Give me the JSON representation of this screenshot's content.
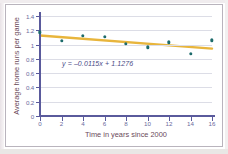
{
  "chart_data": {
    "type": "scatter",
    "title": "",
    "xlabel": "Time in years since 2000",
    "ylabel": "Average home runs per game",
    "xlim": [
      0,
      16
    ],
    "ylim": [
      0,
      1.4
    ],
    "grid": true,
    "legend": "none",
    "x_ticks": [
      "0",
      "2",
      "4",
      "6",
      "8",
      "10",
      "12",
      "14",
      "16"
    ],
    "y_ticks": [
      "0",
      "0.2",
      "0.4",
      "0.6",
      "0.8",
      "1",
      "1.2",
      "1.4"
    ],
    "x": [
      0,
      2,
      4,
      6,
      8,
      10,
      12,
      14,
      16
    ],
    "values": [
      1.17,
      1.05,
      1.12,
      1.11,
      1.01,
      0.96,
      1.03,
      0.87,
      1.06
    ],
    "annotation": "y = –0.0115x + 1.1276",
    "trendline": {
      "slope": -0.0115,
      "intercept": 1.1276,
      "x_start": 0,
      "x_end": 16,
      "y_start": 1.1276,
      "y_end": 0.9436
    },
    "marker_color": "#1d6b6b",
    "trendline_color": "#e8b53c",
    "grid_color": "#dcdde6",
    "axis_color": "#5a5a9c",
    "tick_label_color": "#6b6b9e",
    "axis_title_color": "#6b4a5a",
    "annotation_color": "#4a4a86"
  }
}
